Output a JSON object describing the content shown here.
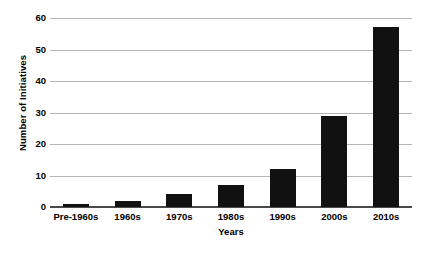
{
  "chart_data": {
    "type": "bar",
    "title": "",
    "xlabel": "Years",
    "ylabel": "Number of Initiatives",
    "categories": [
      "Pre-1960s",
      "1960s",
      "1970s",
      "1980s",
      "1990s",
      "2000s",
      "2010s"
    ],
    "values": [
      1,
      2,
      4,
      7,
      12,
      29,
      57
    ],
    "ylim": [
      0,
      60
    ],
    "yticks": [
      0,
      10,
      20,
      30,
      40,
      50,
      60
    ],
    "ytick_labels": [
      "0",
      "10",
      "20",
      "30",
      "40",
      "50",
      "60"
    ],
    "grid": true,
    "legend": false,
    "bar_color": "#111111",
    "gridline_color": "#b5b5b5",
    "axis_color": "#4a4a4a",
    "background_color": "#ffffff"
  }
}
